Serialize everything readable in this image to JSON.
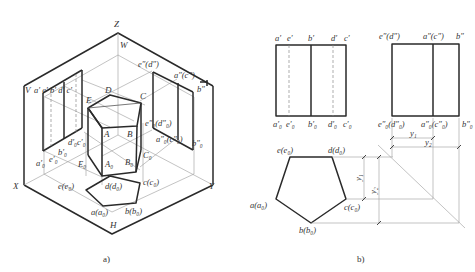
{
  "figure_a": {
    "caption": "a)",
    "axes": {
      "z": "Z",
      "x": "X",
      "y": "Y",
      "h": "H",
      "w": "W",
      "v": "V"
    },
    "solid_top": {
      "A": "A",
      "B": "B",
      "C": "C",
      "D": "D",
      "E": "E"
    },
    "solid_bottom": {
      "A0": "A₀",
      "B0": "B₀",
      "C0": "C₀",
      "E0": "E₀"
    },
    "v_plane": {
      "top": "a′ e′ b′ d′ c′",
      "bottom_a0": "a′₀",
      "bottom_e0": "e′₀",
      "bottom_b0": "b′₀",
      "bottom_d0c0": "d′₀c′₀"
    },
    "w_plane": {
      "top_ed": "e″(d″)",
      "top_ac": "a″(c″)",
      "top_b": "b″",
      "bottom_ed": "e″₀(d″₀)",
      "bottom_ac": "a″₀(c″₀)",
      "bottom_b": "b″₀"
    },
    "h_plane": {
      "e": "e(e₀)",
      "d": "d(d₀)",
      "c": "c(c₀)",
      "a": "a(a₀)",
      "b": "b(b₀)"
    }
  },
  "figure_b": {
    "caption": "b)",
    "front_view": {
      "top": [
        "a′",
        "e′",
        "b′",
        "d′",
        "c′"
      ],
      "bottom": [
        "a′₀",
        "e′₀",
        "b′₀",
        "d′₀",
        "c′₀"
      ]
    },
    "side_view": {
      "top": [
        "e″(d″)",
        "a″(c″)",
        "b″"
      ],
      "bottom": [
        "e″₀(d″₀)",
        "a″₀(c″₀)",
        "b″₀"
      ]
    },
    "top_view": {
      "labels": [
        "e(e₀)",
        "d(d₀)",
        "a(a₀)",
        "c(c₀)",
        "b(b₀)"
      ]
    },
    "dimensions": {
      "y1": "y₁",
      "y2": "y₂"
    }
  }
}
